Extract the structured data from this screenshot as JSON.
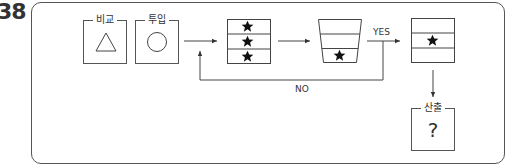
{
  "question_number": "38",
  "inputs": [
    {
      "label": "비교",
      "shape": "triangle-icon"
    },
    {
      "label": "투입",
      "shape": "circle-icon"
    }
  ],
  "process": {
    "stack_rows": [
      {
        "content": "star"
      },
      {
        "content": "star"
      },
      {
        "content": "star"
      }
    ],
    "filter_rows": [
      {
        "content": ""
      },
      {
        "content": ""
      },
      {
        "content": "star"
      }
    ],
    "result_rows": [
      {
        "content": ""
      },
      {
        "content": "star"
      },
      {
        "content": ""
      }
    ]
  },
  "labels": {
    "yes": "YES",
    "no": "NO"
  },
  "output": {
    "label": "산출",
    "value": "?"
  },
  "colors": {
    "line": "#555555",
    "star": "#111111"
  }
}
